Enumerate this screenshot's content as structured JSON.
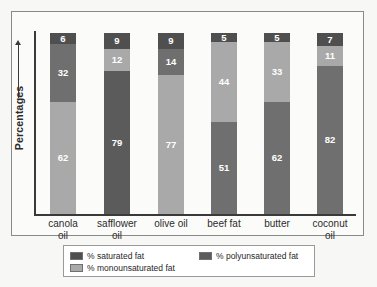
{
  "chart_data": {
    "type": "bar",
    "subtype": "stacked-bar",
    "title": "",
    "xlabel": "",
    "ylabel": "Percentages",
    "ylim": [
      0,
      100
    ],
    "grid": false,
    "legend_position": "bottom",
    "categories": [
      "canola oil",
      "safflower oil",
      "olive oil",
      "beef fat",
      "butter",
      "coconut oil"
    ],
    "series": [
      {
        "name": "% saturated fat",
        "color": "#4f4f4f",
        "values": [
          6,
          9,
          9,
          5,
          5,
          7
        ]
      },
      {
        "name": "% monounsaturated fat",
        "color": "#a9a9a9",
        "values": [
          62,
          12,
          77,
          44,
          33,
          11
        ]
      },
      {
        "name": "% polyunsaturated fat",
        "color": "#6f6f6f",
        "values": [
          32,
          79,
          14,
          51,
          62,
          82
        ]
      }
    ],
    "stack_order_top_to_bottom": [
      [
        "% saturated fat",
        "% polyunsaturated fat",
        "% monounsaturated fat"
      ],
      [
        "% saturated fat",
        "% monounsaturated fat",
        "% polyunsaturated fat"
      ],
      [
        "% saturated fat",
        "% polyunsaturated fat",
        "% monounsaturated fat"
      ],
      [
        "% saturated fat",
        "% monounsaturated fat",
        "% polyunsaturated fat"
      ],
      [
        "% saturated fat",
        "% monounsaturated fat",
        "% polyunsaturated fat"
      ],
      [
        "% saturated fat",
        "% monounsaturated fat",
        "% polyunsaturated fat"
      ]
    ],
    "bars": [
      {
        "category": "canola oil",
        "label_line1": "canola",
        "label_line2": "oil",
        "segments": [
          {
            "series": "% saturated fat",
            "value": 6,
            "label": "6",
            "color": "#4f4f4f"
          },
          {
            "series": "% polyunsaturated fat",
            "value": 32,
            "label": "32",
            "color": "#6f6f6f"
          },
          {
            "series": "% monounsaturated fat",
            "value": 62,
            "label": "62",
            "color": "#a9a9a9"
          }
        ]
      },
      {
        "category": "safflower oil",
        "label_line1": "safflower",
        "label_line2": "oil",
        "segments": [
          {
            "series": "% saturated fat",
            "value": 9,
            "label": "9",
            "color": "#4f4f4f"
          },
          {
            "series": "% monounsaturated fat",
            "value": 12,
            "label": "12",
            "color": "#a9a9a9"
          },
          {
            "series": "% polyunsaturated fat",
            "value": 79,
            "label": "79",
            "color": "#5b5b5b"
          }
        ]
      },
      {
        "category": "olive oil",
        "label_line1": "olive oil",
        "label_line2": "",
        "segments": [
          {
            "series": "% saturated fat",
            "value": 9,
            "label": "9",
            "color": "#4f4f4f"
          },
          {
            "series": "% polyunsaturated fat",
            "value": 14,
            "label": "14",
            "color": "#6f6f6f"
          },
          {
            "series": "% monounsaturated fat",
            "value": 77,
            "label": "77",
            "color": "#a9a9a9"
          }
        ]
      },
      {
        "category": "beef fat",
        "label_line1": "beef fat",
        "label_line2": "",
        "segments": [
          {
            "series": "% saturated fat",
            "value": 5,
            "label": "5",
            "color": "#4f4f4f"
          },
          {
            "series": "% monounsaturated fat",
            "value": 44,
            "label": "44",
            "color": "#a9a9a9"
          },
          {
            "series": "% polyunsaturated fat",
            "value": 51,
            "label": "51",
            "color": "#6f6f6f"
          }
        ]
      },
      {
        "category": "butter",
        "label_line1": "butter",
        "label_line2": "",
        "segments": [
          {
            "series": "% saturated fat",
            "value": 5,
            "label": "5",
            "color": "#4f4f4f"
          },
          {
            "series": "% monounsaturated fat",
            "value": 33,
            "label": "33",
            "color": "#a9a9a9"
          },
          {
            "series": "% polyunsaturated fat",
            "value": 62,
            "label": "62",
            "color": "#6f6f6f"
          }
        ]
      },
      {
        "category": "coconut oil",
        "label_line1": "coconut",
        "label_line2": "oil",
        "segments": [
          {
            "series": "% saturated fat",
            "value": 7,
            "label": "7",
            "color": "#4f4f4f"
          },
          {
            "series": "% monounsaturated fat",
            "value": 11,
            "label": "11",
            "color": "#a9a9a9"
          },
          {
            "series": "% polyunsaturated fat",
            "value": 82,
            "label": "82",
            "color": "#6f6f6f"
          }
        ]
      }
    ],
    "legend": [
      {
        "label": "% saturated fat",
        "color": "#4f4f4f"
      },
      {
        "label": "% monounsaturated fat",
        "color": "#a9a9a9"
      },
      {
        "label": "% polyunsaturated fat",
        "color": "#5b5b5b"
      }
    ]
  }
}
